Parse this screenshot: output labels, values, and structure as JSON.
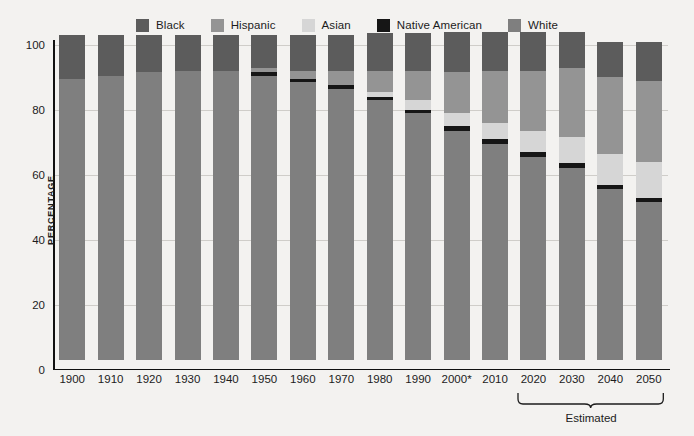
{
  "legend": {
    "items": [
      {
        "label": "Black",
        "color": "#5c5c5c"
      },
      {
        "label": "Hispanic",
        "color": "#949494"
      },
      {
        "label": "Asian",
        "color": "#d6d6d6"
      },
      {
        "label": "Native American",
        "color": "#161616"
      },
      {
        "label": "White",
        "color": "#7f7f7f"
      }
    ]
  },
  "axes": {
    "ylabel": "PERCENTAGE",
    "yticks": [
      "0",
      "20",
      "40",
      "60",
      "80",
      "100"
    ],
    "ylim": [
      0,
      100
    ]
  },
  "annotations": {
    "estimated_label": "Estimated",
    "estimated_span": [
      "2020",
      "2050"
    ]
  },
  "chart_data": {
    "type": "bar",
    "subtype": "stacked-bar",
    "title": "",
    "xlabel": "",
    "ylabel": "PERCENTAGE",
    "ylim": [
      0,
      100
    ],
    "yticks": [
      0,
      20,
      40,
      60,
      80,
      100
    ],
    "grid": true,
    "legend_position": "top",
    "stack_order_bottom_to_top": [
      "White",
      "Native American",
      "Asian",
      "Hispanic",
      "Black"
    ],
    "categories": [
      "1900",
      "1910",
      "1920",
      "1930",
      "1940",
      "1950",
      "1960",
      "1970",
      "1980",
      "1990",
      "2000*",
      "2010",
      "2020",
      "2030",
      "2040",
      "2050"
    ],
    "series": [
      {
        "name": "White",
        "color": "#7f7f7f",
        "values": [
          86.5,
          87.5,
          88.5,
          89.0,
          89.0,
          87.5,
          85.5,
          83.5,
          80.0,
          76.0,
          70.5,
          66.5,
          62.5,
          59.0,
          52.5,
          48.5
        ]
      },
      {
        "name": "Native American",
        "color": "#161616",
        "values": [
          0.0,
          0.0,
          0.0,
          0.0,
          0.0,
          1.0,
          1.0,
          1.0,
          1.0,
          1.0,
          1.5,
          1.5,
          1.5,
          1.5,
          1.5,
          1.5
        ]
      },
      {
        "name": "Asian",
        "color": "#d6d6d6",
        "values": [
          0.0,
          0.0,
          0.0,
          0.0,
          0.0,
          0.0,
          0.0,
          0.0,
          1.5,
          3.0,
          4.0,
          5.0,
          6.5,
          8.0,
          9.5,
          11.0
        ]
      },
      {
        "name": "Hispanic",
        "color": "#949494",
        "values": [
          0.0,
          0.0,
          0.0,
          0.0,
          0.0,
          1.5,
          2.5,
          4.5,
          6.5,
          9.0,
          12.5,
          16.0,
          18.5,
          21.5,
          23.5,
          25.0
        ]
      },
      {
        "name": "Black",
        "color": "#5c5c5c",
        "values": [
          13.5,
          12.5,
          11.5,
          11.0,
          11.0,
          10.0,
          11.0,
          11.0,
          11.5,
          11.5,
          12.5,
          12.0,
          12.0,
          11.0,
          11.0,
          12.0
        ]
      }
    ],
    "totals": [
      100,
      100,
      100,
      100,
      100,
      100,
      100,
      100,
      100,
      100.5,
      101,
      101,
      101,
      101,
      98,
      98
    ]
  }
}
